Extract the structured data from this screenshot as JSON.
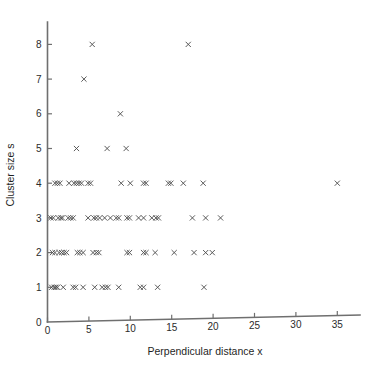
{
  "chart_data": {
    "type": "scatter",
    "title": "",
    "xlabel": "Perpendicular distance x",
    "ylabel": "Cluster size s",
    "xlim": [
      0,
      37.5
    ],
    "ylim": [
      0,
      8.5
    ],
    "grid": false,
    "legend": null,
    "marker": "x",
    "marker_color": "#4a4a4a",
    "xticks": [
      0,
      5,
      10,
      15,
      20,
      25,
      30,
      35
    ],
    "xticklabels": [
      "0",
      "5",
      "10",
      "15",
      "20",
      "25",
      "30",
      "35"
    ],
    "yticks": [
      0,
      1,
      2,
      3,
      4,
      5,
      6,
      7,
      8
    ],
    "yticklabels": [
      "0",
      "1",
      "2",
      "3",
      "4",
      "5",
      "6",
      "7",
      "8"
    ],
    "series": [
      {
        "name": "observations",
        "points": [
          [
            0.5,
            1
          ],
          [
            0.8,
            1
          ],
          [
            1.0,
            1
          ],
          [
            1.2,
            1
          ],
          [
            1.9,
            1
          ],
          [
            3.1,
            1
          ],
          [
            3.4,
            1
          ],
          [
            4.3,
            1
          ],
          [
            5.7,
            1
          ],
          [
            6.6,
            1
          ],
          [
            7.0,
            1
          ],
          [
            7.3,
            1
          ],
          [
            8.6,
            1
          ],
          [
            11.2,
            1
          ],
          [
            11.6,
            1
          ],
          [
            13.3,
            1
          ],
          [
            18.9,
            1
          ],
          [
            0.6,
            2
          ],
          [
            0.9,
            2
          ],
          [
            1.4,
            2
          ],
          [
            1.7,
            2
          ],
          [
            2.0,
            2
          ],
          [
            2.3,
            2
          ],
          [
            3.6,
            2
          ],
          [
            3.9,
            2
          ],
          [
            4.3,
            2
          ],
          [
            5.5,
            2
          ],
          [
            5.9,
            2
          ],
          [
            6.2,
            2
          ],
          [
            9.6,
            2
          ],
          [
            9.9,
            2
          ],
          [
            11.6,
            2
          ],
          [
            11.9,
            2
          ],
          [
            13.0,
            2
          ],
          [
            15.3,
            2
          ],
          [
            17.7,
            2
          ],
          [
            19.1,
            2
          ],
          [
            19.9,
            2
          ],
          [
            0.4,
            3
          ],
          [
            0.7,
            3
          ],
          [
            1.3,
            3
          ],
          [
            1.6,
            3
          ],
          [
            1.8,
            3
          ],
          [
            2.5,
            3
          ],
          [
            2.8,
            3
          ],
          [
            3.1,
            3
          ],
          [
            4.9,
            3
          ],
          [
            5.6,
            3
          ],
          [
            5.9,
            3
          ],
          [
            6.3,
            3
          ],
          [
            6.9,
            3
          ],
          [
            7.6,
            3
          ],
          [
            8.3,
            3
          ],
          [
            8.6,
            3
          ],
          [
            9.6,
            3
          ],
          [
            9.9,
            3
          ],
          [
            11.0,
            3
          ],
          [
            11.6,
            3
          ],
          [
            12.6,
            3
          ],
          [
            13.1,
            3
          ],
          [
            13.4,
            3
          ],
          [
            17.5,
            3
          ],
          [
            19.1,
            3
          ],
          [
            20.9,
            3
          ],
          [
            0.9,
            4
          ],
          [
            1.2,
            4
          ],
          [
            1.5,
            4
          ],
          [
            2.6,
            4
          ],
          [
            3.2,
            4
          ],
          [
            3.5,
            4
          ],
          [
            3.8,
            4
          ],
          [
            4.1,
            4
          ],
          [
            4.9,
            4
          ],
          [
            5.2,
            4
          ],
          [
            8.9,
            4
          ],
          [
            10.0,
            4
          ],
          [
            11.6,
            4
          ],
          [
            11.9,
            4
          ],
          [
            14.6,
            4
          ],
          [
            14.9,
            4
          ],
          [
            16.4,
            4
          ],
          [
            18.8,
            4
          ],
          [
            35.0,
            4
          ],
          [
            3.5,
            5
          ],
          [
            7.2,
            5
          ],
          [
            9.5,
            5
          ],
          [
            8.8,
            6
          ],
          [
            4.4,
            7
          ],
          [
            5.4,
            8
          ],
          [
            17.0,
            8
          ]
        ]
      }
    ]
  },
  "axes": {
    "x_axis_name": "x-axis",
    "y_axis_name": "y-axis"
  }
}
